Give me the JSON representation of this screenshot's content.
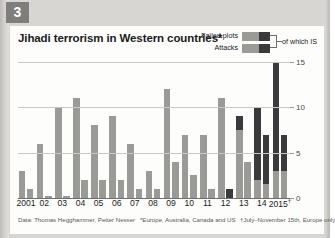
{
  "badge": {
    "number": "3"
  },
  "title": "Jihadi terrorism in Western countries*",
  "legend": {
    "failed_plots_label": "Failed plots",
    "attacks_label": "Attacks",
    "is_label": "of which IS",
    "colors": {
      "base": "#9a9a96",
      "is": "#3a3a3c"
    }
  },
  "footnotes": {
    "source": "Data: Thomas Hegghammer, Petter Nesser",
    "star": "*Europe, Australia, Canada and US",
    "dagger": "†July–November 15th, Europe only"
  },
  "chart_data": {
    "type": "bar",
    "title": "Jihadi terrorism in Western countries*",
    "xlabel": "",
    "ylabel": "",
    "ylim": [
      0,
      15
    ],
    "yticks": [
      0,
      5,
      10,
      15
    ],
    "grid": true,
    "legend_position": "top-right",
    "categories": [
      "2001",
      "02",
      "03",
      "04",
      "05",
      "06",
      "07",
      "08",
      "09",
      "10",
      "11",
      "12",
      "13",
      "14",
      "2015†"
    ],
    "series": [
      {
        "name": "Failed plots",
        "values": [
          3,
          6,
          10,
          11,
          8,
          9,
          6,
          3,
          12,
          7,
          7,
          11,
          9,
          10,
          15
        ],
        "is_values": [
          0,
          0,
          0,
          0,
          0,
          0,
          0,
          0,
          0,
          0,
          0,
          0,
          1.5,
          8,
          12
        ]
      },
      {
        "name": "Attacks",
        "values": [
          1,
          0.2,
          0.2,
          2,
          2,
          2,
          1,
          1,
          4,
          2.5,
          1,
          1,
          4,
          7,
          7
        ],
        "is_values": [
          0,
          0,
          0,
          0,
          0,
          0,
          0,
          0,
          0,
          0,
          0,
          1,
          0,
          5.5,
          4
        ]
      }
    ]
  }
}
